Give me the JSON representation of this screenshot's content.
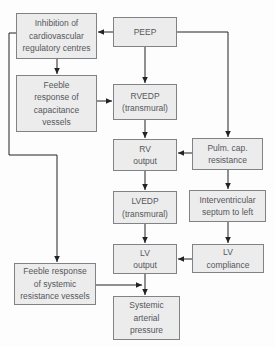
{
  "colors": {
    "background": "#fdfdfd",
    "node_fill": "#ececed",
    "node_border": "#808285",
    "node_text": "#55575a",
    "arrow": "#232323"
  },
  "nodes": {
    "inhibition": {
      "lines": [
        "Inhibition of",
        "cardiovascular",
        "regulatory centres"
      ]
    },
    "peep": {
      "lines": [
        "PEEP"
      ]
    },
    "feeble_capacitance": {
      "lines": [
        "Feeble",
        "response of",
        "capacitance",
        "vessels"
      ]
    },
    "rvedp": {
      "lines": [
        "RVEDP",
        "(transmural)"
      ]
    },
    "rv_output": {
      "lines": [
        "RV",
        "output"
      ]
    },
    "pulm_cap_resistance": {
      "lines": [
        "Pulm. cap.",
        "resistance"
      ]
    },
    "lvedp": {
      "lines": [
        "LVEDP",
        "(transmural)"
      ]
    },
    "interventricular": {
      "lines": [
        "Interventricular",
        "septum to left"
      ]
    },
    "lv_output": {
      "lines": [
        "LV",
        "output"
      ]
    },
    "lv_compliance": {
      "lines": [
        "LV",
        "compliance"
      ]
    },
    "feeble_systemic": {
      "lines": [
        "Feeble response",
        "of systemic",
        "resistance vessels"
      ]
    },
    "systemic_arterial": {
      "lines": [
        "Systemic",
        "arterial",
        "pressure"
      ]
    }
  },
  "edges": [
    {
      "from": "PEEP",
      "to": "Inhibition of cardiovascular regulatory centres"
    },
    {
      "from": "PEEP",
      "to": "RVEDP (transmural)"
    },
    {
      "from": "PEEP",
      "to": "Pulm. cap. resistance"
    },
    {
      "from": "Inhibition of cardiovascular regulatory centres",
      "to": "Feeble response of capacitance vessels"
    },
    {
      "from": "Inhibition of cardiovascular regulatory centres",
      "to": "Feeble response of systemic resistance vessels"
    },
    {
      "from": "Feeble response of capacitance vessels",
      "to": "RVEDP (transmural)"
    },
    {
      "from": "RVEDP (transmural)",
      "to": "RV output"
    },
    {
      "from": "Pulm. cap. resistance",
      "to": "RV output"
    },
    {
      "from": "Pulm. cap. resistance",
      "to": "Interventricular septum to left"
    },
    {
      "from": "RV output",
      "to": "LVEDP (transmural)"
    },
    {
      "from": "LVEDP (transmural)",
      "to": "LV output"
    },
    {
      "from": "Interventricular septum to left",
      "to": "LV compliance"
    },
    {
      "from": "LV compliance",
      "to": "LV output"
    },
    {
      "from": "LV output",
      "to": "Systemic arterial pressure"
    },
    {
      "from": "Feeble response of systemic resistance vessels",
      "to": "Systemic arterial pressure"
    }
  ]
}
